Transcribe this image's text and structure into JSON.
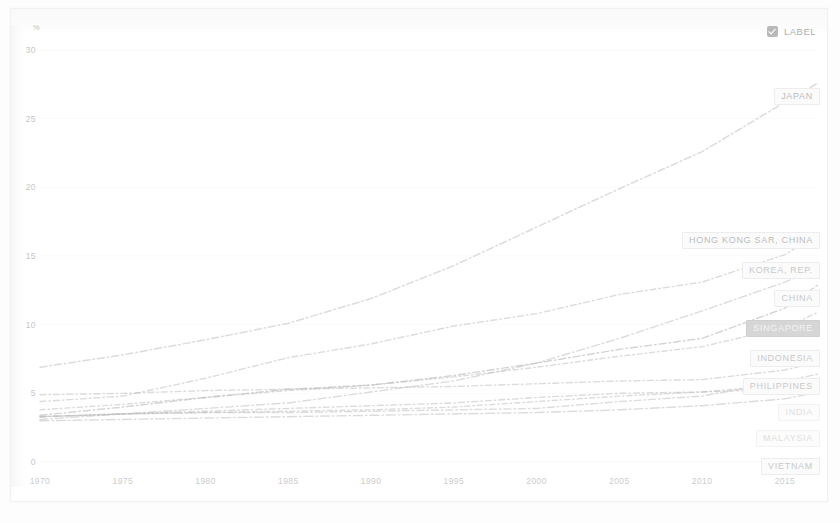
{
  "legend": {
    "checkbox_label": "LABEL",
    "checked": true,
    "icon": "checkbox-checked-icon"
  },
  "axes": {
    "y_unit": "%",
    "y_ticks": [
      "30",
      "25",
      "20",
      "15",
      "10",
      "5",
      "0"
    ],
    "x_ticks": [
      "1970",
      "1975",
      "1980",
      "1985",
      "1990",
      "1995",
      "2000",
      "2005",
      "2010",
      "2015"
    ]
  },
  "colors": {
    "line": "#b9b9b9",
    "label_text": "#c9c9c9",
    "label_box": "#fbfbfb",
    "highlight_bg": "#d6d6d6",
    "highlight_text": "#f4f4f4",
    "axis_text": "#cccccc",
    "grid": "#f4f4f4",
    "background": "#ffffff"
  },
  "series_labels": [
    {
      "name": "JAPAN",
      "style": "mid"
    },
    {
      "name": "HONG KONG SAR, CHINA",
      "style": "mid"
    },
    {
      "name": "KOREA, REP.",
      "style": "normal"
    },
    {
      "name": "CHINA",
      "style": "normal"
    },
    {
      "name": "SINGAPORE",
      "style": "hl"
    },
    {
      "name": "INDONESIA",
      "style": "normal"
    },
    {
      "name": "PHILIPPINES",
      "style": "normal"
    },
    {
      "name": "INDIA",
      "style": "dim"
    },
    {
      "name": "MALAYSIA",
      "style": "dim"
    },
    {
      "name": "VIETNAM",
      "style": "normal"
    }
  ],
  "chart_data": {
    "type": "line",
    "title": "",
    "xlabel": "",
    "ylabel": "%",
    "xlim": [
      1970,
      2017
    ],
    "ylim": [
      0,
      30
    ],
    "grid": false,
    "legend_position": "right-inline-labels",
    "x": [
      1970,
      1975,
      1980,
      1985,
      1990,
      1995,
      2000,
      2005,
      2010,
      2015,
      2017
    ],
    "series": [
      {
        "name": "JAPAN",
        "values": [
          6.9,
          7.8,
          8.9,
          10.1,
          11.9,
          14.3,
          17.1,
          19.9,
          22.6,
          26.2,
          27.6
        ]
      },
      {
        "name": "HONG KONG SAR, CHINA",
        "values": [
          4.4,
          4.8,
          6.1,
          7.6,
          8.6,
          9.9,
          10.8,
          12.2,
          13.1,
          15.1,
          16.6
        ]
      },
      {
        "name": "KOREA, REP.",
        "values": [
          3.1,
          3.5,
          3.9,
          4.3,
          5.1,
          5.9,
          7.2,
          9.0,
          11.0,
          13.1,
          14.1
        ]
      },
      {
        "name": "CHINA",
        "values": [
          3.8,
          4.2,
          4.7,
          5.2,
          5.6,
          6.2,
          6.9,
          7.7,
          8.4,
          9.8,
          10.9
        ]
      },
      {
        "name": "SINGAPORE",
        "values": [
          3.4,
          4.0,
          4.7,
          5.3,
          5.6,
          6.3,
          7.2,
          8.2,
          9.0,
          11.2,
          12.9
        ]
      },
      {
        "name": "INDONESIA",
        "values": [
          3.3,
          3.5,
          3.7,
          3.9,
          4.1,
          4.3,
          4.7,
          5.0,
          5.1,
          5.3,
          5.8
        ]
      },
      {
        "name": "PHILIPPINES",
        "values": [
          3.0,
          3.1,
          3.2,
          3.3,
          3.4,
          3.5,
          3.6,
          3.8,
          4.1,
          4.6,
          5.1
        ]
      },
      {
        "name": "INDIA",
        "values": [
          3.3,
          3.5,
          3.6,
          3.7,
          3.8,
          4.0,
          4.4,
          4.8,
          5.1,
          5.6,
          6.0
        ]
      },
      {
        "name": "MALAYSIA",
        "values": [
          3.3,
          3.5,
          3.6,
          3.6,
          3.7,
          3.8,
          3.9,
          4.4,
          4.8,
          5.9,
          6.4
        ]
      },
      {
        "name": "VIETNAM",
        "values": [
          4.9,
          5.0,
          5.2,
          5.3,
          5.4,
          5.5,
          5.7,
          5.9,
          6.0,
          6.7,
          7.3
        ]
      }
    ]
  }
}
